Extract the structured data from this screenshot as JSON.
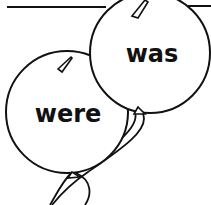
{
  "worksheet": {
    "balloons": [
      {
        "id": "balloon-was",
        "word": "was"
      },
      {
        "id": "balloon-were",
        "word": "were"
      }
    ],
    "colors": {
      "ink": "#111111",
      "background": "#ffffff"
    }
  }
}
